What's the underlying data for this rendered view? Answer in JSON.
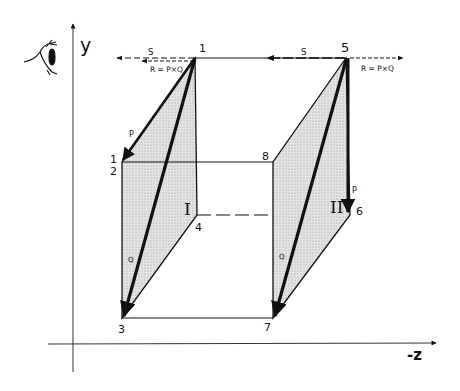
{
  "diagram": {
    "colors": {
      "ink": "#111111",
      "shade": "#d8d8d8",
      "background": "#ffffff"
    },
    "axes": {
      "y_label": "y",
      "z_label": "-z",
      "observer_icon": "eye-icon"
    },
    "points": {
      "p1_top": "1",
      "p2_top": "1",
      "p2_bottom": "2",
      "p3": "3",
      "p4": "4",
      "p5": "5",
      "p6": "6",
      "p7": "7",
      "p8": "8"
    },
    "panels": {
      "left": "I",
      "right": "II"
    },
    "vectors": {
      "left": {
        "p": "P",
        "q": "Q",
        "s": "S",
        "r": "R = P×Q"
      },
      "right": {
        "p": "P",
        "q": "Q",
        "s": "S",
        "r": "R = P×Q"
      }
    }
  }
}
